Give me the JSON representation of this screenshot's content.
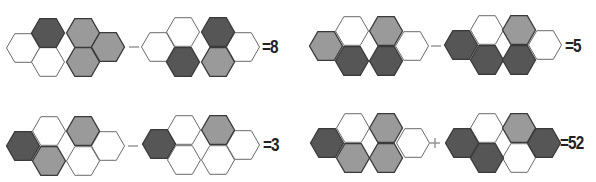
{
  "puzzle": {
    "hex_radius": 16.5,
    "colors": {
      "white": "#ffffff",
      "gray": "#9a9a9a",
      "dark": "#565656",
      "stroke_dark": "#3a3a3a",
      "stroke_light": "#6a6a6a",
      "operator": "#888888"
    },
    "equations": [
      {
        "id": "eq1",
        "operator": "-",
        "operator_pos": [
          134,
          47
        ],
        "result": "=8",
        "result_pos": [
          262,
          38
        ],
        "figures": [
          {
            "hexes": [
              {
                "x": 23,
                "y": 48,
                "fill": "white"
              },
              {
                "x": 48,
                "y": 33,
                "fill": "dark"
              },
              {
                "x": 48,
                "y": 62,
                "fill": "white"
              },
              {
                "x": 83,
                "y": 33,
                "fill": "gray"
              },
              {
                "x": 83,
                "y": 62,
                "fill": "gray"
              },
              {
                "x": 108,
                "y": 47,
                "fill": "gray"
              }
            ]
          },
          {
            "hexes": [
              {
                "x": 158,
                "y": 47,
                "fill": "white"
              },
              {
                "x": 183,
                "y": 32,
                "fill": "white"
              },
              {
                "x": 183,
                "y": 62,
                "fill": "dark"
              },
              {
                "x": 218,
                "y": 32,
                "fill": "dark"
              },
              {
                "x": 218,
                "y": 62,
                "fill": "gray"
              },
              {
                "x": 243,
                "y": 47,
                "fill": "white"
              }
            ]
          }
        ]
      },
      {
        "id": "eq2",
        "operator": "-",
        "operator_pos": [
          436,
          46
        ],
        "result": "=5",
        "result_pos": [
          565,
          37
        ],
        "figures": [
          {
            "hexes": [
              {
                "x": 326,
                "y": 46,
                "fill": "gray"
              },
              {
                "x": 352,
                "y": 31,
                "fill": "white"
              },
              {
                "x": 352,
                "y": 61,
                "fill": "dark"
              },
              {
                "x": 386,
                "y": 31,
                "fill": "gray"
              },
              {
                "x": 386,
                "y": 61,
                "fill": "dark"
              },
              {
                "x": 412,
                "y": 46,
                "fill": "white"
              }
            ]
          },
          {
            "hexes": [
              {
                "x": 461,
                "y": 45,
                "fill": "dark"
              },
              {
                "x": 487,
                "y": 30,
                "fill": "white"
              },
              {
                "x": 487,
                "y": 60,
                "fill": "dark"
              },
              {
                "x": 519,
                "y": 30,
                "fill": "gray"
              },
              {
                "x": 519,
                "y": 60,
                "fill": "dark"
              },
              {
                "x": 545,
                "y": 45,
                "fill": "white"
              }
            ]
          }
        ]
      },
      {
        "id": "eq3",
        "operator": "-",
        "operator_pos": [
          133,
          146
        ],
        "result": "=3",
        "result_pos": [
          263,
          136
        ],
        "figures": [
          {
            "hexes": [
              {
                "x": 23,
                "y": 146,
                "fill": "dark"
              },
              {
                "x": 49,
                "y": 131,
                "fill": "white"
              },
              {
                "x": 49,
                "y": 161,
                "fill": "gray"
              },
              {
                "x": 83,
                "y": 131,
                "fill": "gray"
              },
              {
                "x": 83,
                "y": 161,
                "fill": "white"
              },
              {
                "x": 108,
                "y": 146,
                "fill": "white"
              }
            ]
          },
          {
            "hexes": [
              {
                "x": 159,
                "y": 144,
                "fill": "dark"
              },
              {
                "x": 184,
                "y": 130,
                "fill": "white"
              },
              {
                "x": 184,
                "y": 160,
                "fill": "white"
              },
              {
                "x": 218,
                "y": 130,
                "fill": "gray"
              },
              {
                "x": 218,
                "y": 160,
                "fill": "white"
              },
              {
                "x": 243,
                "y": 145,
                "fill": "white"
              }
            ]
          }
        ]
      },
      {
        "id": "eq4",
        "operator": "+",
        "operator_pos": [
          435,
          143
        ],
        "result": "=52",
        "result_pos": [
          560,
          134
        ],
        "figures": [
          {
            "hexes": [
              {
                "x": 327,
                "y": 143,
                "fill": "dark"
              },
              {
                "x": 353,
                "y": 128,
                "fill": "white"
              },
              {
                "x": 353,
                "y": 158,
                "fill": "gray"
              },
              {
                "x": 386,
                "y": 128,
                "fill": "gray"
              },
              {
                "x": 386,
                "y": 158,
                "fill": "gray"
              },
              {
                "x": 413,
                "y": 143,
                "fill": "white"
              }
            ]
          },
          {
            "hexes": [
              {
                "x": 462,
                "y": 143,
                "fill": "dark"
              },
              {
                "x": 487,
                "y": 128,
                "fill": "white"
              },
              {
                "x": 487,
                "y": 158,
                "fill": "dark"
              },
              {
                "x": 519,
                "y": 128,
                "fill": "gray"
              },
              {
                "x": 519,
                "y": 158,
                "fill": "white"
              },
              {
                "x": 544,
                "y": 143,
                "fill": "dark"
              }
            ]
          }
        ]
      }
    ]
  },
  "results": {
    "eq1": "=8",
    "eq2": "=5",
    "eq3": "=3",
    "eq4": "=52"
  }
}
